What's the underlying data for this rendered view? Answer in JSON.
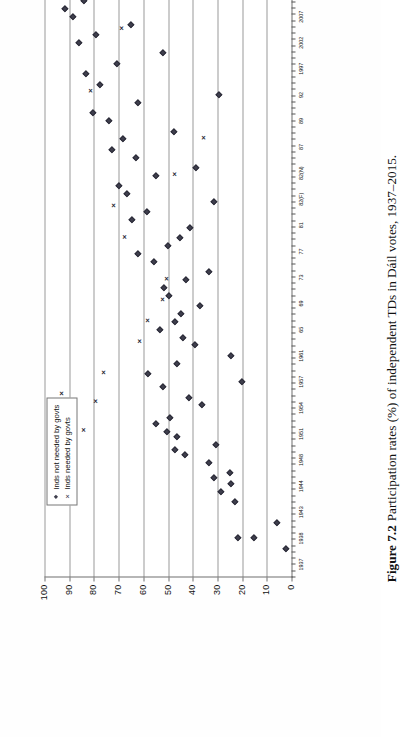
{
  "figure": {
    "label": "Figure 7.2",
    "caption": "Participation rates (%) of independent TDs in Dáil votes, 1937–2015.",
    "orientation": "rotated-90-ccw"
  },
  "legend": {
    "position": "top-left-inside-plot",
    "entries": [
      {
        "marker": "diamond-marker",
        "symbol": "◆",
        "label": "Inds not needed by govts"
      },
      {
        "marker": "cross-marker",
        "symbol": "×",
        "label": "Inds needed by govts"
      }
    ]
  },
  "chart_data": {
    "type": "scatter",
    "title": "Participation rates (%) of independent TDs in Dáil votes, 1937–2015.",
    "xlabel": "",
    "ylabel": "",
    "ylim": [
      0,
      100
    ],
    "yticks": [
      0,
      10,
      20,
      30,
      40,
      50,
      60,
      70,
      80,
      90,
      100
    ],
    "ytick_labels": [
      "0",
      "10",
      "20",
      "30",
      "40",
      "50",
      "60",
      "70",
      "80",
      "90",
      "100"
    ],
    "grid": "horizontal-gridlines-every-10",
    "legend_position": "upper-left",
    "x_categories": [
      "1937",
      "1938",
      "1943",
      "1944",
      "1948",
      "1951",
      "1954",
      "1957",
      "1961",
      "65",
      "69",
      "73",
      "77",
      "81",
      "82(F)",
      "82(N)",
      "87",
      "89",
      "92",
      "1997",
      "2002",
      "2007",
      "2011"
    ],
    "x_major_labels": [
      "1937",
      "1938",
      "1943",
      "1944",
      "1948",
      "1951",
      "1954",
      "1957",
      "1961",
      "65",
      "69",
      "73",
      "77",
      "81",
      "82(F)",
      "82(N)",
      "87",
      "89",
      "92",
      "1997",
      "2002",
      "2007",
      "2011"
    ],
    "series": [
      {
        "name": "Inds not needed by govts",
        "marker": "diamond",
        "points": [
          {
            "x": 0.6,
            "y": 2.0
          },
          {
            "x": 1.0,
            "y": 15.0
          },
          {
            "x": 1.0,
            "y": 21.5
          },
          {
            "x": 1.6,
            "y": 6.0
          },
          {
            "x": 2.4,
            "y": 23.0
          },
          {
            "x": 2.8,
            "y": 28.5
          },
          {
            "x": 3.1,
            "y": 24.5
          },
          {
            "x": 3.3,
            "y": 31.5
          },
          {
            "x": 3.5,
            "y": 25.0
          },
          {
            "x": 3.9,
            "y": 33.5
          },
          {
            "x": 4.2,
            "y": 43.0
          },
          {
            "x": 4.4,
            "y": 47.0
          },
          {
            "x": 4.6,
            "y": 30.5
          },
          {
            "x": 4.9,
            "y": 46.5
          },
          {
            "x": 5.1,
            "y": 50.5
          },
          {
            "x": 5.4,
            "y": 55.0
          },
          {
            "x": 5.6,
            "y": 49.0
          },
          {
            "x": 6.1,
            "y": 36.0
          },
          {
            "x": 6.4,
            "y": 41.5
          },
          {
            "x": 6.8,
            "y": 52.0
          },
          {
            "x": 7.0,
            "y": 20.0
          },
          {
            "x": 7.3,
            "y": 58.0
          },
          {
            "x": 7.7,
            "y": 46.5
          },
          {
            "x": 8.0,
            "y": 24.5
          },
          {
            "x": 8.4,
            "y": 39.0
          },
          {
            "x": 8.7,
            "y": 44.0
          },
          {
            "x": 9.0,
            "y": 53.0
          },
          {
            "x": 9.3,
            "y": 47.0
          },
          {
            "x": 9.6,
            "y": 44.5
          },
          {
            "x": 9.9,
            "y": 37.0
          },
          {
            "x": 10.3,
            "y": 49.5
          },
          {
            "x": 10.6,
            "y": 51.5
          },
          {
            "x": 10.9,
            "y": 42.5
          },
          {
            "x": 11.2,
            "y": 33.5
          },
          {
            "x": 11.6,
            "y": 55.5
          },
          {
            "x": 11.9,
            "y": 62.0
          },
          {
            "x": 12.2,
            "y": 50.0
          },
          {
            "x": 12.5,
            "y": 45.0
          },
          {
            "x": 12.9,
            "y": 41.0
          },
          {
            "x": 13.2,
            "y": 64.5
          },
          {
            "x": 13.5,
            "y": 58.5
          },
          {
            "x": 13.9,
            "y": 31.5
          },
          {
            "x": 14.2,
            "y": 66.5
          },
          {
            "x": 14.5,
            "y": 70.0
          },
          {
            "x": 14.9,
            "y": 55.0
          },
          {
            "x": 15.2,
            "y": 38.5
          },
          {
            "x": 15.6,
            "y": 63.0
          },
          {
            "x": 15.9,
            "y": 72.5
          },
          {
            "x": 16.3,
            "y": 68.0
          },
          {
            "x": 16.6,
            "y": 47.5
          },
          {
            "x": 17.0,
            "y": 74.0
          },
          {
            "x": 17.3,
            "y": 80.5
          },
          {
            "x": 17.7,
            "y": 62.0
          },
          {
            "x": 18.0,
            "y": 29.5
          },
          {
            "x": 18.4,
            "y": 77.5
          },
          {
            "x": 18.8,
            "y": 83.0
          },
          {
            "x": 19.2,
            "y": 70.5
          },
          {
            "x": 19.6,
            "y": 52.0
          },
          {
            "x": 20.0,
            "y": 86.0
          },
          {
            "x": 20.3,
            "y": 79.0
          },
          {
            "x": 20.7,
            "y": 65.0
          },
          {
            "x": 21.0,
            "y": 88.5
          },
          {
            "x": 21.3,
            "y": 91.5
          },
          {
            "x": 21.6,
            "y": 84.0
          },
          {
            "x": 21.9,
            "y": 74.5
          },
          {
            "x": 22.2,
            "y": 93.0
          },
          {
            "x": 22.5,
            "y": 87.0
          },
          {
            "x": 22.8,
            "y": 80.0
          }
        ]
      },
      {
        "name": "Inds needed by govts",
        "marker": "cross",
        "points": [
          {
            "x": 3.9,
            "y": 87.5
          },
          {
            "x": 4.6,
            "y": 90.0
          },
          {
            "x": 5.2,
            "y": 84.0
          },
          {
            "x": 5.4,
            "y": 91.0
          },
          {
            "x": 6.0,
            "y": 88.0
          },
          {
            "x": 6.3,
            "y": 79.0
          },
          {
            "x": 6.6,
            "y": 93.0
          },
          {
            "x": 7.4,
            "y": 76.0
          },
          {
            "x": 8.6,
            "y": 61.5
          },
          {
            "x": 9.4,
            "y": 58.0
          },
          {
            "x": 10.2,
            "y": 52.0
          },
          {
            "x": 11.0,
            "y": 50.5
          },
          {
            "x": 12.6,
            "y": 67.5
          },
          {
            "x": 13.8,
            "y": 72.0
          },
          {
            "x": 15.0,
            "y": 47.0
          },
          {
            "x": 16.4,
            "y": 35.5
          },
          {
            "x": 18.2,
            "y": 81.0
          },
          {
            "x": 20.6,
            "y": 68.5
          }
        ]
      }
    ]
  }
}
